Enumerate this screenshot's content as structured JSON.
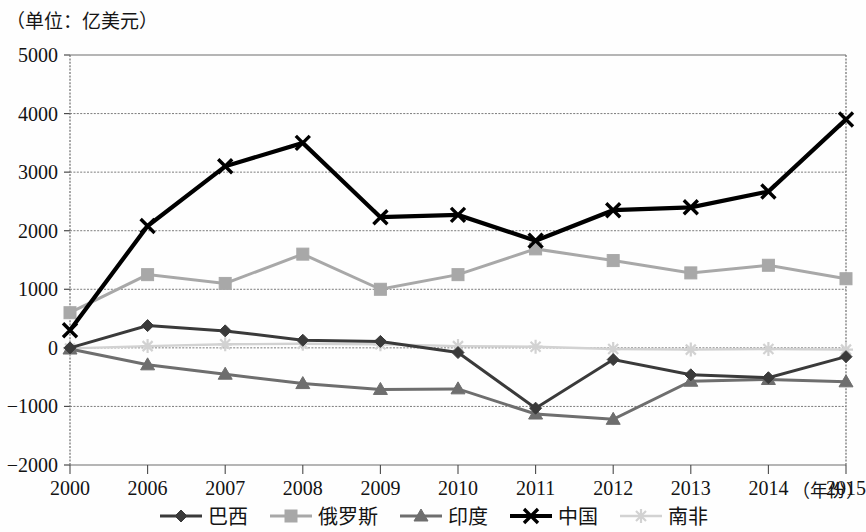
{
  "unit_label": "（单位：亿美元）",
  "x_axis_name": "（年份）",
  "axis": {
    "y_ticks": [
      "5000",
      "4000",
      "3000",
      "2000",
      "1000",
      "0",
      "-1000",
      "-2000"
    ],
    "x_ticks": [
      "2000",
      "2006",
      "2007",
      "2008",
      "2009",
      "2010",
      "2011",
      "2012",
      "2013",
      "2014",
      "2015"
    ]
  },
  "legend": [
    {
      "label": "巴西",
      "marker": "diamond",
      "color": "#3a3a3a"
    },
    {
      "label": "俄罗斯",
      "marker": "square",
      "color": "#a8a8a8"
    },
    {
      "label": "印度",
      "marker": "triangle",
      "color": "#6e6e6e"
    },
    {
      "label": "中国",
      "marker": "cross",
      "color": "#000000"
    },
    {
      "label": "南非",
      "marker": "asterisk",
      "color": "#d2d2d2"
    }
  ],
  "chart_data": {
    "type": "line",
    "title": "",
    "subtitle": "",
    "xlabel": "（年份）",
    "ylabel": "（单位：亿美元）",
    "ylim": [
      -2000,
      5000
    ],
    "ytick_step": 1000,
    "grid": true,
    "legend_position": "bottom",
    "categories": [
      "2000",
      "2006",
      "2007",
      "2008",
      "2009",
      "2010",
      "2011",
      "2012",
      "2013",
      "2014",
      "2015"
    ],
    "series": [
      {
        "name": "巴西",
        "marker": "diamond",
        "color": "#3a3a3a",
        "values": [
          0,
          380,
          290,
          130,
          110,
          -80,
          -1030,
          -200,
          -460,
          -510,
          -150
        ]
      },
      {
        "name": "俄罗斯",
        "marker": "square",
        "color": "#a8a8a8",
        "values": [
          600,
          1250,
          1100,
          1600,
          1000,
          1250,
          1690,
          1490,
          1280,
          1410,
          1180
        ]
      },
      {
        "name": "印度",
        "marker": "triangle",
        "color": "#6e6e6e",
        "values": [
          -20,
          -290,
          -450,
          -610,
          -710,
          -700,
          -1130,
          -1220,
          -570,
          -540,
          -580
        ]
      },
      {
        "name": "中国",
        "marker": "cross",
        "color": "#000000",
        "values": [
          300,
          2080,
          3100,
          3500,
          2230,
          2270,
          1830,
          2350,
          2400,
          2670,
          3900
        ]
      },
      {
        "name": "南非",
        "marker": "asterisk",
        "color": "#d2d2d2",
        "values": [
          -10,
          30,
          60,
          70,
          60,
          30,
          20,
          -20,
          -30,
          -20,
          -30
        ]
      }
    ]
  }
}
